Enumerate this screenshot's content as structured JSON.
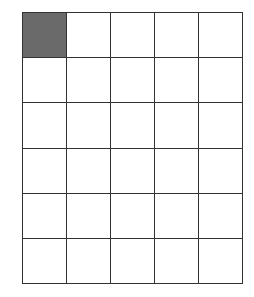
{
  "grid": {
    "rows": 6,
    "cols": 5,
    "line_color": "#333333",
    "empty_color": "#ffffff",
    "fill_color": "#6a6a6a",
    "filled_cells": [
      [
        0,
        0
      ]
    ]
  }
}
